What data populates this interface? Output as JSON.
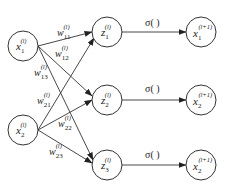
{
  "diagram": {
    "type": "neural-network-layer",
    "inputs": [
      {
        "id": "x1",
        "base": "x",
        "sub": "1",
        "sup": "(l)"
      },
      {
        "id": "x2",
        "base": "x",
        "sub": "2",
        "sup": "(l)"
      }
    ],
    "hidden": [
      {
        "id": "z1",
        "base": "z",
        "sub": "1",
        "sup": "(l)"
      },
      {
        "id": "z2",
        "base": "z",
        "sub": "2",
        "sup": "(l)"
      },
      {
        "id": "z3",
        "base": "z",
        "sub": "3",
        "sup": "(l)"
      }
    ],
    "outputs": [
      {
        "id": "y1",
        "base": "x",
        "sub": "1",
        "sup": "(l+1)"
      },
      {
        "id": "y2",
        "base": "x",
        "sub": "2",
        "sup": "(l+1)"
      },
      {
        "id": "y3",
        "base": "x",
        "sub": "2",
        "sup": "(l+1)"
      }
    ],
    "weights": [
      {
        "from": "x1",
        "to": "z1",
        "base": "w",
        "sub": "11",
        "sup": "(l)"
      },
      {
        "from": "x1",
        "to": "z2",
        "base": "w",
        "sub": "12",
        "sup": "(l)"
      },
      {
        "from": "x1",
        "to": "z3",
        "base": "w",
        "sub": "13",
        "sup": "(l)"
      },
      {
        "from": "x2",
        "to": "z1",
        "base": "w",
        "sub": "21",
        "sup": "(l)"
      },
      {
        "from": "x2",
        "to": "z2",
        "base": "w",
        "sub": "22",
        "sup": "(l)"
      },
      {
        "from": "x2",
        "to": "z3",
        "base": "w",
        "sub": "23",
        "sup": "(l)"
      }
    ],
    "activation": {
      "label": "σ( )"
    },
    "colors": {
      "stroke": "#333333",
      "text": "#222222",
      "background": "#ffffff"
    }
  }
}
